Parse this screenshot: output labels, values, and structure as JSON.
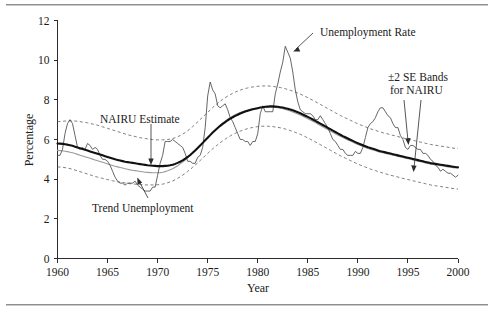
{
  "figure": {
    "title": "",
    "y_axis_label": "Percentage",
    "x_axis_label": "Year"
  },
  "annotations": {
    "nairu_estimate": "NAIRU Estimate",
    "trend_unemployment": "Trend Unemployment",
    "unemployment_rate": "Unemployment Rate",
    "se_bands_line1": "±2 SE Bands",
    "se_bands_line2": "for NAIRU"
  },
  "colors": {
    "unemployment_rate": "#4a4a4a",
    "nairu_estimate": "#111111",
    "trend_unemployment": "#9a9a9a",
    "se_bands": "#6f6f6f",
    "axis": "#2b2b2b",
    "background": "#ffffff"
  },
  "chart_data": {
    "type": "line",
    "title": "",
    "xlabel": "Year",
    "ylabel": "Percentage",
    "xlim": [
      1960,
      2000
    ],
    "ylim": [
      0,
      12
    ],
    "xticks": [
      1960,
      1965,
      1970,
      1975,
      1980,
      1985,
      1990,
      1995,
      2000
    ],
    "yticks": [
      0,
      2,
      4,
      6,
      8,
      10,
      12
    ],
    "grid": false,
    "legend": "annotations-inline",
    "x": [
      1960,
      1960.25,
      1960.5,
      1960.75,
      1961,
      1961.25,
      1961.5,
      1961.75,
      1962,
      1962.25,
      1962.5,
      1962.75,
      1963,
      1963.25,
      1963.5,
      1963.75,
      1964,
      1964.25,
      1964.5,
      1964.75,
      1965,
      1965.25,
      1965.5,
      1965.75,
      1966,
      1966.25,
      1966.5,
      1966.75,
      1967,
      1967.25,
      1967.5,
      1967.75,
      1968,
      1968.25,
      1968.5,
      1968.75,
      1969,
      1969.25,
      1969.5,
      1969.75,
      1970,
      1970.25,
      1970.5,
      1970.75,
      1971,
      1971.25,
      1971.5,
      1971.75,
      1972,
      1972.25,
      1972.5,
      1972.75,
      1973,
      1973.25,
      1973.5,
      1973.75,
      1974,
      1974.25,
      1974.5,
      1974.75,
      1975,
      1975.25,
      1975.5,
      1975.75,
      1976,
      1976.25,
      1976.5,
      1976.75,
      1977,
      1977.25,
      1977.5,
      1977.75,
      1978,
      1978.25,
      1978.5,
      1978.75,
      1979,
      1979.25,
      1979.5,
      1979.75,
      1980,
      1980.25,
      1980.5,
      1980.75,
      1981,
      1981.25,
      1981.5,
      1981.75,
      1982,
      1982.25,
      1982.5,
      1982.75,
      1983,
      1983.25,
      1983.5,
      1983.75,
      1984,
      1984.25,
      1984.5,
      1984.75,
      1985,
      1985.25,
      1985.5,
      1985.75,
      1986,
      1986.25,
      1986.5,
      1986.75,
      1987,
      1987.25,
      1987.5,
      1987.75,
      1988,
      1988.25,
      1988.5,
      1988.75,
      1989,
      1989.25,
      1989.5,
      1989.75,
      1990,
      1990.25,
      1990.5,
      1990.75,
      1991,
      1991.25,
      1991.5,
      1991.75,
      1992,
      1992.25,
      1992.5,
      1992.75,
      1993,
      1993.25,
      1993.5,
      1993.75,
      1994,
      1994.25,
      1994.5,
      1994.75,
      1995,
      1995.25,
      1995.5,
      1995.75,
      1996,
      1996.25,
      1996.5,
      1996.75,
      1997,
      1997.25,
      1997.5,
      1997.75,
      1998,
      1998.25,
      1998.5,
      1998.75,
      1999,
      1999.25,
      1999.5,
      1999.75,
      2000
    ],
    "series": [
      {
        "name": "Unemployment Rate",
        "style": "thin-solid",
        "color": "#4a4a4a",
        "values": [
          5.2,
          5.2,
          5.5,
          6.3,
          6.8,
          7.0,
          6.8,
          6.2,
          5.6,
          5.5,
          5.6,
          5.5,
          5.8,
          5.7,
          5.5,
          5.6,
          5.5,
          5.2,
          5.0,
          5.0,
          4.9,
          4.7,
          4.4,
          4.1,
          3.9,
          3.8,
          3.8,
          3.7,
          3.8,
          3.8,
          3.8,
          3.9,
          3.7,
          3.6,
          3.5,
          3.4,
          3.4,
          3.4,
          3.6,
          3.6,
          4.2,
          4.8,
          5.2,
          5.9,
          5.9,
          5.9,
          6.0,
          5.9,
          5.8,
          5.7,
          5.6,
          5.3,
          4.9,
          4.9,
          4.8,
          4.8,
          5.1,
          5.2,
          5.6,
          6.6,
          8.2,
          8.9,
          8.5,
          8.3,
          7.7,
          7.6,
          7.7,
          7.8,
          7.5,
          7.1,
          6.9,
          6.6,
          6.3,
          6.0,
          6.0,
          5.9,
          5.9,
          5.7,
          5.9,
          5.9,
          6.3,
          7.3,
          7.7,
          7.4,
          7.4,
          7.4,
          7.4,
          8.3,
          8.8,
          9.4,
          9.9,
          10.7,
          10.4,
          10.1,
          9.4,
          8.5,
          7.9,
          7.5,
          7.4,
          7.3,
          7.3,
          7.3,
          7.2,
          7.0,
          7.0,
          7.2,
          7.0,
          6.8,
          6.6,
          6.3,
          6.0,
          5.9,
          5.7,
          5.5,
          5.5,
          5.3,
          5.2,
          5.2,
          5.2,
          5.4,
          5.3,
          5.3,
          5.6,
          6.1,
          6.6,
          6.8,
          6.9,
          7.1,
          7.4,
          7.6,
          7.6,
          7.4,
          7.2,
          7.1,
          6.8,
          6.6,
          6.6,
          6.2,
          6.0,
          5.6,
          5.5,
          5.7,
          5.7,
          5.6,
          5.5,
          5.5,
          5.3,
          5.3,
          5.2,
          5.0,
          4.9,
          4.7,
          4.6,
          4.4,
          4.5,
          4.4,
          4.3,
          4.3,
          4.2,
          4.1,
          4.2
        ]
      },
      {
        "name": "NAIRU Estimate",
        "style": "thick-solid",
        "color": "#111111",
        "values": [
          5.8,
          5.79,
          5.78,
          5.76,
          5.74,
          5.71,
          5.68,
          5.64,
          5.6,
          5.56,
          5.52,
          5.48,
          5.44,
          5.4,
          5.36,
          5.32,
          5.28,
          5.24,
          5.2,
          5.16,
          5.12,
          5.08,
          5.04,
          5.0,
          4.97,
          4.94,
          4.91,
          4.88,
          4.86,
          4.84,
          4.82,
          4.8,
          4.78,
          4.76,
          4.74,
          4.72,
          4.7,
          4.69,
          4.68,
          4.67,
          4.66,
          4.66,
          4.66,
          4.67,
          4.68,
          4.7,
          4.73,
          4.77,
          4.82,
          4.88,
          4.95,
          5.03,
          5.12,
          5.22,
          5.33,
          5.45,
          5.57,
          5.7,
          5.83,
          5.96,
          6.09,
          6.22,
          6.35,
          6.47,
          6.58,
          6.69,
          6.79,
          6.88,
          6.97,
          7.05,
          7.12,
          7.19,
          7.25,
          7.31,
          7.36,
          7.41,
          7.45,
          7.49,
          7.52,
          7.55,
          7.58,
          7.61,
          7.63,
          7.65,
          7.66,
          7.67,
          7.67,
          7.66,
          7.65,
          7.63,
          7.61,
          7.58,
          7.55,
          7.51,
          7.47,
          7.42,
          7.37,
          7.32,
          7.26,
          7.2,
          7.14,
          7.08,
          7.01,
          6.94,
          6.87,
          6.8,
          6.73,
          6.66,
          6.59,
          6.52,
          6.45,
          6.38,
          6.31,
          6.24,
          6.17,
          6.11,
          6.05,
          5.99,
          5.93,
          5.87,
          5.81,
          5.76,
          5.71,
          5.66,
          5.61,
          5.57,
          5.53,
          5.49,
          5.45,
          5.41,
          5.38,
          5.35,
          5.32,
          5.29,
          5.26,
          5.23,
          5.2,
          5.17,
          5.14,
          5.11,
          5.08,
          5.05,
          5.02,
          4.99,
          4.96,
          4.93,
          4.9,
          4.87,
          4.84,
          4.81,
          4.79,
          4.77,
          4.75,
          4.73,
          4.71,
          4.69,
          4.67,
          4.65,
          4.63,
          4.61,
          4.6
        ]
      },
      {
        "name": "Trend Unemployment",
        "style": "thin-gray-solid",
        "color": "#9a9a9a",
        "values": [
          5.45,
          5.44,
          5.43,
          5.41,
          5.39,
          5.36,
          5.33,
          5.29,
          5.25,
          5.21,
          5.17,
          5.13,
          5.09,
          5.05,
          5.01,
          4.97,
          4.93,
          4.89,
          4.85,
          4.81,
          4.77,
          4.73,
          4.69,
          4.65,
          4.62,
          4.59,
          4.56,
          4.53,
          4.5,
          4.47,
          4.45,
          4.43,
          4.41,
          4.39,
          4.37,
          4.35,
          4.34,
          4.33,
          4.32,
          4.32,
          4.32,
          4.33,
          4.35,
          4.38,
          4.42,
          4.47,
          4.53,
          4.6,
          4.68,
          4.77,
          4.86,
          4.96,
          5.07,
          5.19,
          5.31,
          5.44,
          5.57,
          5.7,
          5.83,
          5.96,
          6.09,
          6.22,
          6.35,
          6.48,
          6.6,
          6.72,
          6.83,
          6.93,
          7.02,
          7.1,
          7.18,
          7.25,
          7.31,
          7.36,
          7.41,
          7.45,
          7.49,
          7.52,
          7.55,
          7.57,
          7.59,
          7.61,
          7.62,
          7.63,
          7.64,
          7.64,
          7.63,
          7.62,
          7.6,
          7.58,
          7.55,
          7.52,
          7.48,
          7.44,
          7.39,
          7.34,
          7.29,
          7.23,
          7.17,
          7.11,
          7.05,
          6.98,
          6.92,
          6.85,
          6.78,
          6.71,
          6.64,
          6.57,
          6.5,
          6.43,
          6.36,
          6.29,
          6.22,
          6.16,
          6.1,
          6.04,
          5.98,
          5.92,
          5.86,
          5.8,
          5.75,
          5.7,
          5.65,
          5.6,
          5.55,
          5.51,
          5.47,
          5.43,
          5.39,
          5.36,
          5.33,
          5.3,
          5.27,
          5.24,
          5.21,
          5.18,
          5.15,
          5.12,
          5.09,
          5.06,
          5.03,
          5.0,
          4.97,
          4.94,
          4.91,
          4.88,
          4.85,
          4.82,
          4.79,
          4.76,
          4.74,
          4.72,
          4.7,
          4.68,
          4.66,
          4.64,
          4.62,
          4.6,
          4.58,
          4.56,
          4.55
        ]
      },
      {
        "name": "+2 SE Band",
        "style": "dashed",
        "color": "#6f6f6f",
        "values": [
          6.9,
          6.91,
          6.92,
          6.93,
          6.94,
          6.94,
          6.94,
          6.93,
          6.92,
          6.9,
          6.88,
          6.86,
          6.84,
          6.81,
          6.78,
          6.75,
          6.72,
          6.68,
          6.64,
          6.6,
          6.56,
          6.52,
          6.48,
          6.44,
          6.4,
          6.36,
          6.32,
          6.28,
          6.24,
          6.21,
          6.18,
          6.15,
          6.12,
          6.09,
          6.07,
          6.05,
          6.03,
          6.01,
          6.0,
          5.99,
          5.98,
          5.98,
          5.98,
          5.99,
          6.0,
          6.02,
          6.05,
          6.09,
          6.14,
          6.2,
          6.27,
          6.35,
          6.44,
          6.54,
          6.65,
          6.77,
          6.89,
          7.01,
          7.13,
          7.25,
          7.37,
          7.49,
          7.61,
          7.72,
          7.83,
          7.93,
          8.02,
          8.11,
          8.19,
          8.26,
          8.33,
          8.39,
          8.44,
          8.49,
          8.53,
          8.57,
          8.6,
          8.63,
          8.65,
          8.67,
          8.68,
          8.69,
          8.7,
          8.7,
          8.7,
          8.69,
          8.68,
          8.66,
          8.64,
          8.62,
          8.59,
          8.56,
          8.52,
          8.48,
          8.44,
          8.39,
          8.34,
          8.29,
          8.23,
          8.17,
          8.11,
          8.04,
          7.98,
          7.91,
          7.84,
          7.77,
          7.7,
          7.63,
          7.56,
          7.49,
          7.42,
          7.35,
          7.28,
          7.21,
          7.15,
          7.09,
          7.03,
          6.97,
          6.91,
          6.85,
          6.79,
          6.74,
          6.69,
          6.64,
          6.59,
          6.54,
          6.5,
          6.46,
          6.42,
          6.38,
          6.34,
          6.31,
          6.28,
          6.24,
          6.21,
          6.18,
          6.15,
          6.11,
          6.08,
          6.05,
          6.02,
          5.99,
          5.96,
          5.93,
          5.9,
          5.87,
          5.84,
          5.81,
          5.78,
          5.75,
          5.73,
          5.71,
          5.69,
          5.67,
          5.65,
          5.63,
          5.61,
          5.59,
          5.57,
          5.55,
          5.54
        ]
      },
      {
        "name": "-2 SE Band",
        "style": "dashed",
        "color": "#6f6f6f",
        "values": [
          4.62,
          4.61,
          4.6,
          4.58,
          4.56,
          4.53,
          4.5,
          4.46,
          4.42,
          4.38,
          4.34,
          4.3,
          4.26,
          4.22,
          4.18,
          4.14,
          4.1,
          4.07,
          4.04,
          4.01,
          3.98,
          3.95,
          3.92,
          3.89,
          3.87,
          3.85,
          3.83,
          3.81,
          3.79,
          3.77,
          3.76,
          3.75,
          3.74,
          3.73,
          3.72,
          3.71,
          3.71,
          3.71,
          3.71,
          3.71,
          3.72,
          3.73,
          3.75,
          3.78,
          3.82,
          3.86,
          3.91,
          3.97,
          4.04,
          4.12,
          4.2,
          4.29,
          4.39,
          4.49,
          4.6,
          4.71,
          4.82,
          4.94,
          5.06,
          5.18,
          5.3,
          5.42,
          5.53,
          5.64,
          5.74,
          5.84,
          5.93,
          6.02,
          6.1,
          6.18,
          6.25,
          6.31,
          6.37,
          6.42,
          6.47,
          6.51,
          6.55,
          6.58,
          6.61,
          6.63,
          6.65,
          6.66,
          6.67,
          6.67,
          6.67,
          6.66,
          6.65,
          6.63,
          6.61,
          6.59,
          6.56,
          6.53,
          6.49,
          6.45,
          6.41,
          6.36,
          6.31,
          6.26,
          6.2,
          6.14,
          6.08,
          6.01,
          5.95,
          5.88,
          5.81,
          5.74,
          5.67,
          5.6,
          5.53,
          5.46,
          5.39,
          5.32,
          5.25,
          5.18,
          5.12,
          5.06,
          5.0,
          4.94,
          4.88,
          4.82,
          4.76,
          4.71,
          4.66,
          4.61,
          4.56,
          4.51,
          4.47,
          4.43,
          4.39,
          4.35,
          4.31,
          4.27,
          4.24,
          4.2,
          4.17,
          4.14,
          4.11,
          4.07,
          4.04,
          4.01,
          3.98,
          3.95,
          3.92,
          3.89,
          3.86,
          3.83,
          3.8,
          3.77,
          3.74,
          3.71,
          3.69,
          3.67,
          3.65,
          3.63,
          3.61,
          3.59,
          3.57,
          3.55,
          3.53,
          3.51,
          3.5
        ]
      }
    ]
  }
}
